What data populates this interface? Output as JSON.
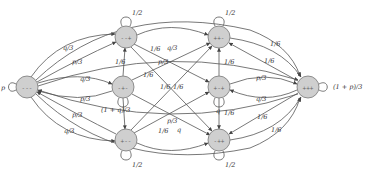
{
  "diagram": {
    "type": "markov-chain",
    "nodes": [
      {
        "id": "n0",
        "label": "---"
      },
      {
        "id": "n1",
        "label": "--+"
      },
      {
        "id": "n2",
        "label": "-+-"
      },
      {
        "id": "n3",
        "label": "+--"
      },
      {
        "id": "n4",
        "label": "++-"
      },
      {
        "id": "n5",
        "label": "+-+"
      },
      {
        "id": "n6",
        "label": "-++"
      },
      {
        "id": "n7",
        "label": "+++"
      }
    ],
    "self_loops": [
      {
        "node": "n0",
        "label": "p"
      },
      {
        "node": "n1",
        "label": "1/2"
      },
      {
        "node": "n2",
        "label": "(1 + q)/3"
      },
      {
        "node": "n3",
        "label": "1/2"
      },
      {
        "node": "n4",
        "label": "1/2"
      },
      {
        "node": "n5",
        "label": "q"
      },
      {
        "node": "n6",
        "label": "1/2"
      },
      {
        "node": "n7",
        "label": "(1 + p)/3"
      }
    ],
    "edges": [
      {
        "from": "n0",
        "to": "n1",
        "label": "q/3"
      },
      {
        "from": "n1",
        "to": "n0",
        "label": "p/3"
      },
      {
        "from": "n0",
        "to": "n2",
        "label": "q/3"
      },
      {
        "from": "n2",
        "to": "n0",
        "label": "p/3"
      },
      {
        "from": "n3",
        "to": "n0",
        "label": "p/3"
      },
      {
        "from": "n0",
        "to": "n3",
        "label": "q/3"
      },
      {
        "from": "n2",
        "to": "n1",
        "label": "1/6"
      },
      {
        "from": "n1",
        "to": "n4",
        "label": "1/6"
      },
      {
        "from": "n4",
        "to": "n1",
        "label": "q/3"
      },
      {
        "from": "n1",
        "to": "n5",
        "label": "p/3"
      },
      {
        "from": "n2",
        "to": "n4",
        "label": "1/6"
      },
      {
        "from": "n2",
        "to": "n6",
        "label": "1/6"
      },
      {
        "from": "n6",
        "to": "n2",
        "label": "1/6"
      },
      {
        "from": "n3",
        "to": "n5",
        "label": "p/3"
      },
      {
        "from": "n3",
        "to": "n6",
        "label": "1/6"
      },
      {
        "from": "n5",
        "to": "n3",
        "label": "q"
      },
      {
        "from": "n4",
        "to": "n5",
        "label": "1/6"
      },
      {
        "from": "n4",
        "to": "n7",
        "label": "1/6"
      },
      {
        "from": "n5",
        "to": "n7",
        "label": "1/6"
      },
      {
        "from": "n7",
        "to": "n5",
        "label": "p/3"
      },
      {
        "from": "n7",
        "to": "n4",
        "label": "1/6"
      },
      {
        "from": "n6",
        "to": "n7",
        "label": "1/6"
      },
      {
        "from": "n7",
        "to": "n6",
        "label": "q/3"
      },
      {
        "from": "n7",
        "to": "n5",
        "label": "1/6"
      }
    ]
  }
}
